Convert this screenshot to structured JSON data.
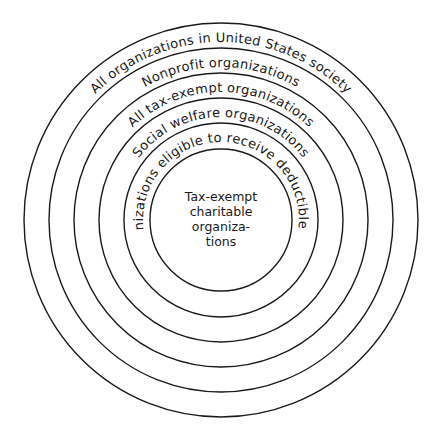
{
  "diagram": {
    "type": "nested-concentric-circles",
    "rings": [
      {
        "level": 1,
        "label": "All organizations in United States society"
      },
      {
        "level": 2,
        "label": "Nonprofit organizations"
      },
      {
        "level": 3,
        "label": "All tax-exempt organizations"
      },
      {
        "level": 4,
        "label": "Social welfare organizations"
      },
      {
        "level": 5,
        "label": "Organizations eligible to receive deductible gifts"
      }
    ],
    "center": {
      "lines": [
        "Tax-exempt",
        "charitable",
        "organiza-",
        "tions"
      ]
    },
    "colors": {
      "stroke": "#1a1a1a",
      "background": "#ffffff"
    }
  }
}
